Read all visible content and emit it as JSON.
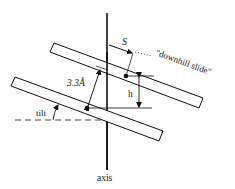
{
  "diagram": {
    "type": "schematic",
    "labels": {
      "spacing": "3.3Å",
      "slide": "S",
      "slide_note": "\"downhill slide\"",
      "height": "h",
      "tilt": "tilt",
      "axis": "axis"
    },
    "colors": {
      "line": "#111111",
      "background": "#ffffff"
    }
  }
}
